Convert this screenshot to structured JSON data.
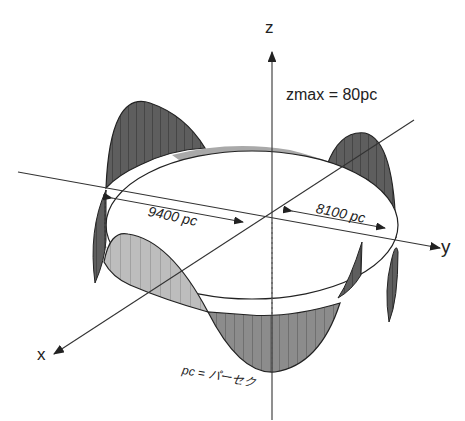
{
  "figure": {
    "axes": {
      "x": "x",
      "y": "y",
      "z": "z"
    },
    "annotations": {
      "zmax": "zmax = 80pc",
      "radius_1": "9400 pc",
      "radius_2": "8100 pc",
      "unit_note": "pc = パーセク"
    },
    "colors": {
      "line": "#333333",
      "shade_dark": "#4a4a4a",
      "shade_mid": "#8a8a8a",
      "shade_light": "#c8c8c8",
      "background": "#ffffff"
    }
  }
}
